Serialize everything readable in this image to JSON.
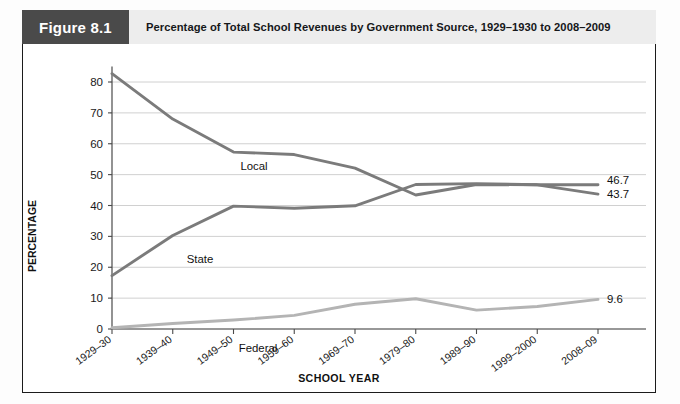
{
  "figure": {
    "tag": "Figure 8.1",
    "title": "Percentage of Total School Revenues by Government Source, 1929–1930 to 2008–2009"
  },
  "axes": {
    "ylabel": "PERCENTAGE",
    "xlabel": "SCHOOL YEAR",
    "yticks": [
      "0",
      "10",
      "20",
      "30",
      "40",
      "50",
      "60",
      "70",
      "80"
    ],
    "xticks": [
      "1929–30",
      "1939–40",
      "1949–50",
      "1959–60",
      "1969–70",
      "1979–80",
      "1989–90",
      "1999–2000",
      "2008–09"
    ]
  },
  "series_labels": {
    "local": "Local",
    "state": "State",
    "federal": "Federal"
  },
  "end_labels": {
    "local": "43.7",
    "state": "46.7",
    "federal": "9.6"
  },
  "colors": {
    "local": "#7b7b7b",
    "state": "#7b7b7b",
    "federal": "#b4b4b4",
    "grid": "#d0d0d0",
    "axis": "#4a4a4a",
    "header_tag_bg": "#4a4a4a",
    "header_title_bg": "#ededed"
  },
  "chart_data": {
    "type": "line",
    "title": "Percentage of Total School Revenues by Government Source, 1929–1930 to 2008–2009",
    "xlabel": "SCHOOL YEAR",
    "ylabel": "PERCENTAGE",
    "categories": [
      "1929–30",
      "1939–40",
      "1949–50",
      "1959–60",
      "1969–70",
      "1979–80",
      "1989–90",
      "1999–2000",
      "2008–09"
    ],
    "series": [
      {
        "name": "Local",
        "values": [
          82.7,
          68.0,
          57.3,
          56.5,
          52.1,
          43.4,
          46.8,
          46.7,
          43.7
        ],
        "end_label": "43.7",
        "color": "#7b7b7b"
      },
      {
        "name": "State",
        "values": [
          17.3,
          30.3,
          39.8,
          39.1,
          39.9,
          46.8,
          47.1,
          46.7,
          46.7
        ],
        "end_label": "46.7",
        "color": "#7b7b7b"
      },
      {
        "name": "Federal",
        "values": [
          0.4,
          1.8,
          2.9,
          4.4,
          8.0,
          9.8,
          6.1,
          7.3,
          9.6
        ],
        "end_label": "9.6",
        "color": "#b4b4b4"
      }
    ],
    "ylim": [
      0,
      85
    ],
    "ytick_values": [
      0,
      10,
      20,
      30,
      40,
      50,
      60,
      70,
      80
    ],
    "grid": true,
    "legend": "inline-labels"
  }
}
